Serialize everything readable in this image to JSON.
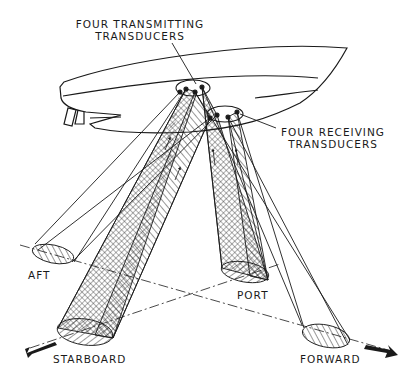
{
  "diagram": {
    "type": "technical-illustration",
    "labels": {
      "transmitting_line1": "FOUR TRANSMITTING",
      "transmitting_line2": "TRANSDUCERS",
      "receiving_line1": "FOUR RECEIVING",
      "receiving_line2": "TRANSDUCERS",
      "aft": "AFT",
      "port": "PORT",
      "starboard": "STARBOARD",
      "forward": "FORWARD"
    },
    "beams": [
      {
        "name": "aft",
        "footprint": "hatched ellipse, left"
      },
      {
        "name": "starboard",
        "footprint": "cross-hatched cone, lower left"
      },
      {
        "name": "port",
        "footprint": "cross-hatched cone, center right"
      },
      {
        "name": "forward",
        "footprint": "hatched ellipse, lower right"
      }
    ],
    "colors": {
      "ink": "#1a1a1a",
      "paper": "#ffffff"
    }
  }
}
